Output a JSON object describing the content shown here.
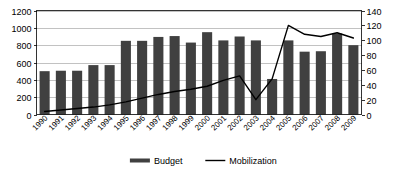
{
  "chart_data": {
    "type": "bar",
    "title": "",
    "subtitle": "",
    "xlabel": "",
    "ylabel": "",
    "y2label": "",
    "grid": true,
    "legend_position": "bottom-center",
    "categories": [
      "1990",
      "1991",
      "1992",
      "1993",
      "1994",
      "1995",
      "1996",
      "1997",
      "1998",
      "1999",
      "2000",
      "2001",
      "2002",
      "2003",
      "2004",
      "2005",
      "2006",
      "2007",
      "2008",
      "2009"
    ],
    "ylim": [
      0,
      1200
    ],
    "yticks": [
      0,
      200,
      400,
      600,
      800,
      1000,
      1200
    ],
    "y2lim": [
      0,
      140
    ],
    "y2ticks": [
      0,
      20,
      40,
      60,
      80,
      100,
      120,
      140
    ],
    "series": [
      {
        "name": "Budget",
        "kind": "bar",
        "axis": "left",
        "color": "#404040",
        "values": [
          500,
          505,
          505,
          570,
          570,
          850,
          850,
          895,
          905,
          830,
          950,
          855,
          900,
          855,
          410,
          855,
          725,
          730,
          935,
          800
        ]
      },
      {
        "name": "Mobilization",
        "kind": "line",
        "axis": "right",
        "color": "#000000",
        "values": [
          4,
          6,
          8,
          10,
          13,
          17,
          22,
          27,
          31,
          34,
          38,
          46,
          52,
          20,
          48,
          120,
          108,
          105,
          110,
          103
        ]
      }
    ],
    "legend": [
      {
        "label": "Budget",
        "marker": "thick-bar",
        "color": "#404040"
      },
      {
        "label": "Mobilization",
        "marker": "thin-line",
        "color": "#000000"
      }
    ]
  },
  "axes": {
    "left_tick_labels": [
      "1200",
      "1000",
      "800",
      "600",
      "400",
      "200",
      "0"
    ],
    "right_tick_labels": [
      "140",
      "120",
      "100",
      "80",
      "60",
      "40",
      "20",
      "0"
    ]
  }
}
